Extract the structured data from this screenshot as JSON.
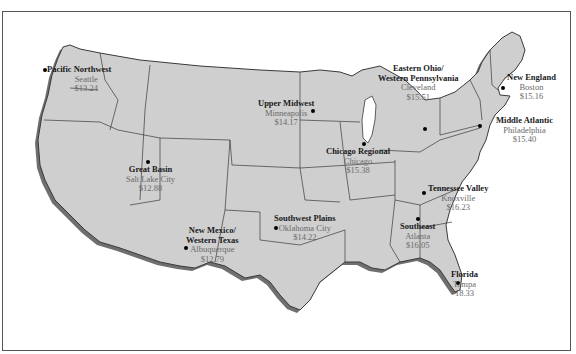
{
  "map": {
    "type": "choropleth-outline",
    "subject": "United States regional map with city wage values",
    "colors": {
      "land": "#cfcfcf",
      "border": "#3a3a3a",
      "shadow": "#6f6f6f",
      "background": "#ffffff",
      "region_text": "#1a1a1a",
      "value_text": "#6a6a6a"
    },
    "regions": [
      {
        "name": "Pacific Northwest",
        "city": "Seattle",
        "value": "$13.24"
      },
      {
        "name": "Upper Midwest",
        "city": "Minneapolis",
        "value": "$14.17"
      },
      {
        "name": "Eastern Ohio/",
        "name2": "Western Pennsylvania",
        "city": "Cleveland",
        "value": "$15.51"
      },
      {
        "name": "New England",
        "city": "Boston",
        "value": "$15.16"
      },
      {
        "name": "Middle Atlantic",
        "city": "Philadelphia",
        "value": "$15.40"
      },
      {
        "name": "Great Basin",
        "city": "Salt Lake City",
        "value": "$12.88"
      },
      {
        "name": "Chicago Regional",
        "city": "Chicago",
        "value": "$15.38"
      },
      {
        "name": "Tennessee Valley",
        "city": "Knoxville",
        "value": "$16.23"
      },
      {
        "name": "Southwest Plains",
        "city": "Oklahoma City",
        "value": "$14.22"
      },
      {
        "name": "Southeast",
        "city": "Atlanta",
        "value": "$16.05"
      },
      {
        "name": "New Mexico/",
        "name2": "Western Texas",
        "city": "Albuquerque",
        "value": "$12.79"
      },
      {
        "name": "Florida",
        "city": "Tampa",
        "value": "18.33"
      }
    ]
  }
}
